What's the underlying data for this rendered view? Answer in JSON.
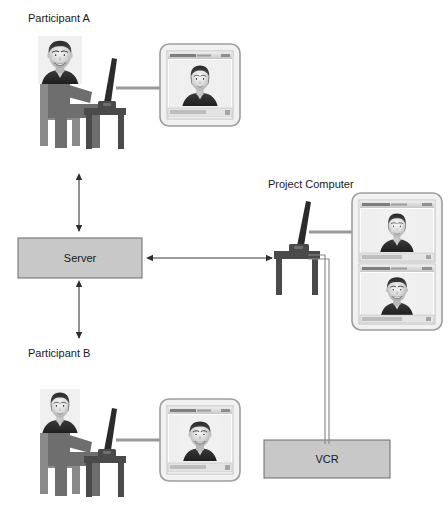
{
  "diagram": {
    "labels": {
      "participant_a": "Participant A",
      "participant_b": "Participant B",
      "project_computer": "Project Computer"
    },
    "nodes": [
      {
        "id": "server",
        "label": "Server",
        "shape": "rectangle",
        "fill": "#c8c8c8",
        "stroke": "#6b6b6b"
      },
      {
        "id": "vcr",
        "label": "VCR",
        "shape": "rectangle",
        "fill": "#c8c8c8",
        "stroke": "#6b6b6b"
      }
    ],
    "workstations": [
      {
        "id": "participant-a",
        "label": "Participant A",
        "person": "man",
        "monitor_shows": "woman",
        "monitor_title": "Video window"
      },
      {
        "id": "participant-b",
        "label": "Participant B",
        "person": "woman",
        "monitor_shows": "man",
        "monitor_title": "Video window"
      },
      {
        "id": "project-computer",
        "label": "Project Computer",
        "person": "none",
        "monitor_shows": "woman and man",
        "monitor_title": "Video window"
      }
    ],
    "connections": [
      {
        "from": "participant-a",
        "to": "server",
        "type": "double-arrow",
        "orientation": "vertical"
      },
      {
        "from": "server",
        "to": "participant-b",
        "type": "double-arrow",
        "orientation": "vertical"
      },
      {
        "from": "server",
        "to": "project-computer",
        "type": "double-arrow",
        "orientation": "horizontal"
      },
      {
        "from": "project-computer",
        "to": "vcr",
        "type": "cable",
        "orientation": "vertical"
      },
      {
        "from": "participant-a-laptop",
        "to": "participant-a-monitor",
        "type": "cable",
        "orientation": "horizontal"
      },
      {
        "from": "participant-b-laptop",
        "to": "participant-b-monitor",
        "type": "cable",
        "orientation": "horizontal"
      },
      {
        "from": "project-computer-laptop",
        "to": "project-computer-monitors",
        "type": "cable",
        "orientation": "horizontal"
      }
    ],
    "colors": {
      "box_fill": "#c8c8c8",
      "box_stroke": "#6b6b6b",
      "figure_body": "#6e6e6e",
      "chair": "#8a8a8a",
      "desk": "#4a4a4a",
      "cable": "#9a9a9a",
      "arrow": "#3a3a3a",
      "background": "#ffffff",
      "text": "#1a1a1a"
    }
  }
}
